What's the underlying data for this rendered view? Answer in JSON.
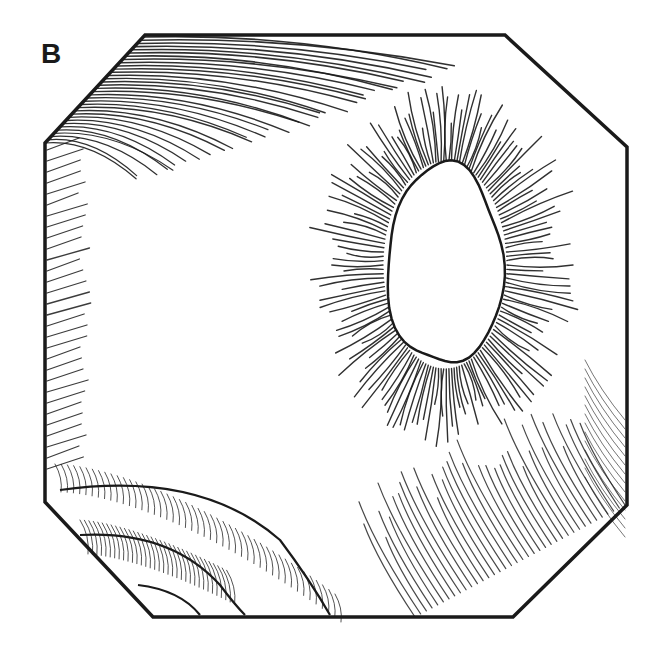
{
  "figure": {
    "panel_label": "B",
    "ink_color": "#1a1a1a",
    "background": "#ffffff",
    "octagon_points": [
      [
        145,
        35
      ],
      [
        505,
        35
      ],
      [
        627,
        147
      ],
      [
        627,
        505
      ],
      [
        513,
        617
      ],
      [
        153,
        617
      ],
      [
        45,
        502
      ],
      [
        45,
        143
      ]
    ],
    "hole": {
      "cx": 445,
      "cy": 265,
      "rx": 58,
      "ry": 100
    },
    "hatching": {
      "top_left_corner": {
        "count": 34
      },
      "left_edge": {
        "count": 30
      },
      "hole_rays": {
        "count": 150,
        "inner_pad": 4,
        "min_len": 35,
        "max_len": 78
      },
      "bottom_right": {
        "count": 38
      },
      "bottom_left_bands": {
        "count": 46
      }
    }
  }
}
